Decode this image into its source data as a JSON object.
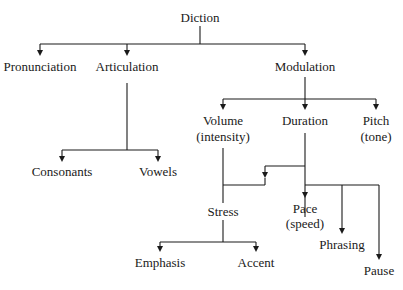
{
  "diagram": {
    "root": "Diction",
    "level1": {
      "pronunciation": "Pronunciation",
      "articulation": "Articulation",
      "modulation": "Modulation"
    },
    "articulation_children": {
      "consonants": "Consonants",
      "vowels": "Vowels"
    },
    "modulation_children": {
      "volume": "Volume",
      "volume_sub": "(intensity)",
      "duration": "Duration",
      "pitch": "Pitch",
      "pitch_sub": "(tone)"
    },
    "duration_children": {
      "stress": "Stress",
      "pace": "Pace",
      "pace_sub": "(speed)",
      "phrasing": "Phrasing",
      "pause": "Pause"
    },
    "stress_children": {
      "emphasis": "Emphasis",
      "accent": "Accent"
    },
    "colors": {
      "line": "#1a1a1a",
      "text": "#1a1a1a",
      "background": "#ffffff"
    }
  }
}
